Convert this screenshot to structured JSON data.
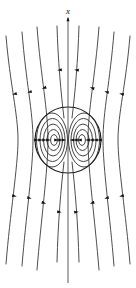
{
  "figure": {
    "background_color": "#ffffff",
    "width": 136,
    "height": 288,
    "axis": {
      "label": "x",
      "label_x": 68,
      "label_y": 13,
      "direction": "up",
      "line_x": 68,
      "line_top": 18,
      "line_bottom": 283,
      "color": "#4a4a4a"
    },
    "sphere": {
      "center_x": 68,
      "center_y": 140,
      "radius": 33,
      "color": "#1c1c1c"
    },
    "colors": {
      "stroke": "#3a3a3a",
      "loop_stroke": "#2e2e2e",
      "boundary_stroke": "#1c1c1c",
      "arrow_fill": "#111111",
      "label_fill": "#111111"
    }
  },
  "chart_data": {
    "type": "line",
    "xlabel": "",
    "ylabel": "x",
    "grid": false,
    "legend": null,
    "annotations": [
      {
        "text": "x",
        "x": 68,
        "y": 13,
        "style": "italic"
      }
    ],
    "series": [
      {
        "name": "outer-streamline-left-1",
        "path": "M 6,36 C 10,84 18,114 18,140 C 18,166 10,214 6,264",
        "arrows": [
          {
            "x": 14.5,
            "y": 94,
            "angle": 166
          },
          {
            "x": 14.5,
            "y": 196,
            "angle": 14
          }
        ]
      },
      {
        "name": "outer-streamline-left-2",
        "path": "M 22,32 C 26,82 33,112 33,140 C 33,168 26,216 22,266",
        "arrows": [
          {
            "x": 29.5,
            "y": 92,
            "angle": 164
          },
          {
            "x": 29.5,
            "y": 198,
            "angle": 16
          }
        ]
      },
      {
        "name": "outer-streamline-left-3",
        "path": "M 37,27 C 41,78 48,110 48,140 C 48,170 41,220 37,270",
        "arrows": [
          {
            "x": 44,
            "y": 88,
            "angle": 162
          },
          {
            "x": 44,
            "y": 203,
            "angle": 18
          }
        ]
      },
      {
        "name": "inner-streamline-left",
        "path": "M 57,26 C 58,60 61,94 64,118",
        "arrows": [
          {
            "x": 59.5,
            "y": 70,
            "angle": 172
          }
        ]
      },
      {
        "name": "inner-streamline-right",
        "path": "M 79,26 C 78,60 75,94 72,118",
        "arrows": [
          {
            "x": 76.5,
            "y": 70,
            "angle": 188
          }
        ]
      },
      {
        "name": "inner-streamline-left-lower",
        "path": "M 64,162 C 61,188 58,222 57,262",
        "arrows": [
          {
            "x": 59.5,
            "y": 212,
            "angle": 8
          }
        ]
      },
      {
        "name": "inner-streamline-right-lower",
        "path": "M 72,162 C 75,188 78,222 79,262",
        "arrows": [
          {
            "x": 76.5,
            "y": 212,
            "angle": -8
          }
        ]
      },
      {
        "name": "outer-streamline-right-3",
        "path": "M 99,27 C 95,78 88,110 88,140 C 88,170 95,220 99,270",
        "arrows": [
          {
            "x": 92,
            "y": 88,
            "angle": 198
          },
          {
            "x": 92,
            "y": 203,
            "angle": 162
          }
        ]
      },
      {
        "name": "outer-streamline-right-2",
        "path": "M 114,32 C 110,82 103,112 103,140 C 103,168 110,216 114,266",
        "arrows": [
          {
            "x": 106.5,
            "y": 92,
            "angle": 196
          },
          {
            "x": 106.5,
            "y": 198,
            "angle": 164
          }
        ]
      },
      {
        "name": "outer-streamline-right-1",
        "path": "M 130,36 C 126,84 118,114 118,140 C 118,166 126,214 130,264",
        "arrows": [
          {
            "x": 121.5,
            "y": 94,
            "angle": 194
          },
          {
            "x": 121.5,
            "y": 196,
            "angle": 166
          }
        ]
      },
      {
        "name": "vortex-loop-left-1",
        "cx": 52,
        "cy": 140,
        "rx": 15.5,
        "ry": 27
      },
      {
        "name": "vortex-loop-left-2",
        "cx": 52.5,
        "cy": 140,
        "rx": 12.5,
        "ry": 21.5
      },
      {
        "name": "vortex-loop-left-3",
        "cx": 53,
        "cy": 140,
        "rx": 9.5,
        "ry": 16
      },
      {
        "name": "vortex-loop-left-4",
        "cx": 53.5,
        "cy": 140,
        "rx": 6.5,
        "ry": 10.5
      },
      {
        "name": "vortex-loop-left-5",
        "cx": 54,
        "cy": 140,
        "rx": 3.4,
        "ry": 5.4
      },
      {
        "name": "vortex-loop-right-1",
        "cx": 84,
        "cy": 140,
        "rx": 15.5,
        "ry": 27
      },
      {
        "name": "vortex-loop-right-2",
        "cx": 83.5,
        "cy": 140,
        "rx": 12.5,
        "ry": 21.5
      },
      {
        "name": "vortex-loop-right-3",
        "cx": 83,
        "cy": 140,
        "rx": 9.5,
        "ry": 16
      },
      {
        "name": "vortex-loop-right-4",
        "cx": 82.5,
        "cy": 140,
        "rx": 6.5,
        "ry": 10.5
      },
      {
        "name": "vortex-loop-right-5",
        "cx": 82,
        "cy": 140,
        "rx": 3.4,
        "ry": 5.4
      }
    ],
    "inner_arrows_left": [
      {
        "x": 36.5,
        "y": 140,
        "angle": 0
      },
      {
        "x": 40.5,
        "y": 140,
        "angle": 0
      },
      {
        "x": 44.5,
        "y": 140,
        "angle": 0
      },
      {
        "x": 48.5,
        "y": 140,
        "angle": 0
      },
      {
        "x": 56.5,
        "y": 140,
        "angle": 0
      },
      {
        "x": 60.5,
        "y": 140,
        "angle": 0
      },
      {
        "x": 64.0,
        "y": 140,
        "angle": 0
      }
    ],
    "inner_arrows_right": [
      {
        "x": 72.0,
        "y": 140,
        "angle": 180
      },
      {
        "x": 75.5,
        "y": 140,
        "angle": 180
      },
      {
        "x": 79.5,
        "y": 140,
        "angle": 180
      },
      {
        "x": 87.5,
        "y": 140,
        "angle": 180
      },
      {
        "x": 91.5,
        "y": 140,
        "angle": 180
      },
      {
        "x": 95.5,
        "y": 140,
        "angle": 180
      },
      {
        "x": 99.5,
        "y": 140,
        "angle": 180
      }
    ],
    "axis_arrow": {
      "x": 68,
      "y": 19,
      "angle": -90
    }
  }
}
